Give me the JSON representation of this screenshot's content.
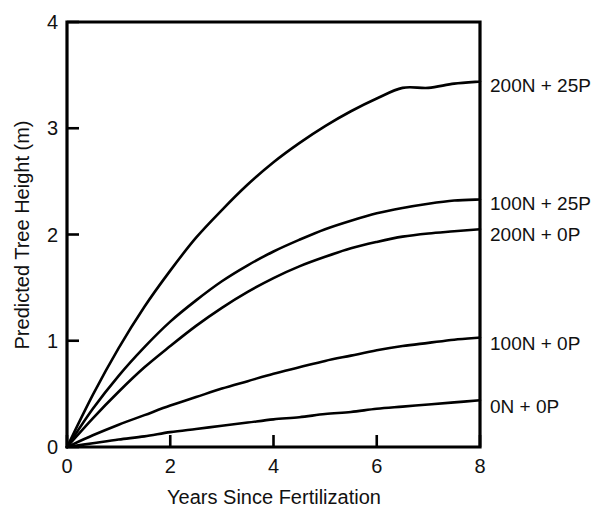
{
  "chart_data": {
    "type": "line",
    "title": "",
    "xlabel": "Years Since Fertilization",
    "ylabel": "Predicted Tree Height (m)",
    "xlim": [
      0,
      8
    ],
    "ylim": [
      0,
      4
    ],
    "xticks": [
      0,
      2,
      4,
      6,
      8
    ],
    "yticks": [
      0,
      1,
      2,
      3,
      4
    ],
    "xtick_labels": [
      "0",
      "2",
      "4",
      "6",
      "8"
    ],
    "ytick_labels": [
      "0",
      "1",
      "2",
      "3",
      "4"
    ],
    "grid": false,
    "legend_position": "right-of-axes-inline",
    "x": [
      0,
      0.5,
      1,
      1.5,
      2,
      2.5,
      3,
      3.5,
      4,
      4.5,
      5,
      5.5,
      6,
      6.5,
      7,
      7.5,
      8
    ],
    "series": [
      {
        "name": "200N + 25P",
        "label": "200N + 25P",
        "color": "#000000",
        "end_value": 3.44,
        "values": [
          0,
          0.49,
          0.93,
          1.32,
          1.66,
          1.97,
          2.23,
          2.47,
          2.68,
          2.86,
          3.02,
          3.16,
          3.28,
          3.38,
          3.38,
          3.42,
          3.44
        ]
      },
      {
        "name": "100N + 25P",
        "label": "100N + 25P",
        "color": "#000000",
        "end_value": 2.33,
        "values": [
          0,
          0.36,
          0.67,
          0.94,
          1.18,
          1.38,
          1.56,
          1.71,
          1.84,
          1.95,
          2.05,
          2.13,
          2.2,
          2.25,
          2.29,
          2.32,
          2.33
        ]
      },
      {
        "name": "200N + 0P",
        "label": "200N + 0P",
        "color": "#000000",
        "end_value": 2.05,
        "values": [
          0,
          0.27,
          0.52,
          0.75,
          0.95,
          1.14,
          1.31,
          1.46,
          1.59,
          1.7,
          1.79,
          1.87,
          1.93,
          1.98,
          2.01,
          2.03,
          2.05
        ]
      },
      {
        "name": "100N + 0P",
        "label": "100N + 0P",
        "color": "#000000",
        "end_value": 1.03,
        "values": [
          0,
          0.11,
          0.21,
          0.3,
          0.39,
          0.47,
          0.55,
          0.62,
          0.69,
          0.75,
          0.81,
          0.86,
          0.91,
          0.95,
          0.98,
          1.01,
          1.03
        ]
      },
      {
        "name": "0N + 0P",
        "label": "0N + 0P",
        "color": "#000000",
        "end_value": 0.44,
        "values": [
          0,
          0.035,
          0.07,
          0.1,
          0.14,
          0.17,
          0.2,
          0.23,
          0.26,
          0.28,
          0.31,
          0.33,
          0.36,
          0.38,
          0.4,
          0.42,
          0.44
        ]
      }
    ]
  },
  "axes": {
    "x_title": "Years Since Fertilization",
    "y_title": "Predicted Tree Height (m)",
    "x_tick_labels": [
      "0",
      "2",
      "4",
      "6",
      "8"
    ],
    "y_tick_labels": [
      "0",
      "1",
      "2",
      "3",
      "4"
    ]
  },
  "series_labels": [
    {
      "text": "200N + 25P"
    },
    {
      "text": "100N + 25P"
    },
    {
      "text": "200N + 0P"
    },
    {
      "text": "100N + 0P"
    },
    {
      "text": "0N + 0P"
    }
  ],
  "colors": {
    "background": "#ffffff",
    "ink": "#000000",
    "text": "#111111"
  }
}
